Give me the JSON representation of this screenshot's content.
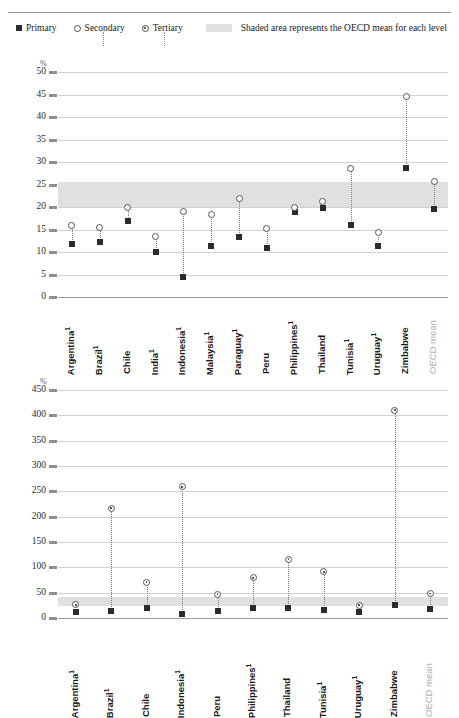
{
  "header": {
    "clipped_title": "",
    "legend": [
      {
        "label": "Primary",
        "marker": "filled-square-icon"
      },
      {
        "label": "Secondary",
        "marker": "open-circle-icon"
      },
      {
        "label": "Tertiary",
        "marker": "dotted-circle-icon"
      }
    ],
    "shaded_note": "Shaded area represents the OECD mean for each level",
    "shaded_swatch_color": "#e2e2e2"
  },
  "chart_data": [
    {
      "type": "scatter",
      "id": "chart-upper",
      "title": "",
      "xlabel": "",
      "ylabel": "%",
      "ylim": [
        0,
        50
      ],
      "yticks": [
        0,
        5,
        10,
        15,
        20,
        25,
        30,
        35,
        40,
        45,
        50
      ],
      "grid": true,
      "legend_position": "top",
      "band": {
        "label": "OECD mean",
        "from": 20.0,
        "to": 25.5,
        "color": "#e0e0e0"
      },
      "categories": [
        "Argentina¹",
        "Brazil¹",
        "Chile",
        "India¹",
        "Indonesia¹",
        "Malaysia¹",
        "Paraguay¹",
        "Peru",
        "Philippines¹",
        "Thailand",
        "Tunisia¹",
        "Uruguay¹",
        "Zimbabwe",
        "OECD mean"
      ],
      "series": [
        {
          "name": "Primary",
          "marker": "square",
          "values": [
            11.8,
            12.3,
            17.0,
            10.0,
            4.5,
            11.3,
            13.3,
            10.8,
            19.0,
            19.8,
            16.0,
            11.3,
            28.7,
            19.6
          ]
        },
        {
          "name": "Secondary",
          "marker": "circle",
          "values": [
            15.8,
            15.5,
            19.8,
            13.5,
            19.0,
            18.3,
            21.8,
            15.3,
            19.8,
            21.3,
            28.5,
            14.3,
            44.5,
            25.6
          ]
        }
      ]
    },
    {
      "type": "scatter",
      "id": "chart-lower",
      "title": "",
      "xlabel": "",
      "ylabel": "%",
      "ylim": [
        0,
        450
      ],
      "yticks": [
        0,
        50,
        100,
        150,
        200,
        250,
        300,
        350,
        400,
        450
      ],
      "grid": true,
      "legend_position": "top",
      "band": {
        "label": "OECD mean",
        "from": 23,
        "to": 42,
        "color": "#e0e0e0"
      },
      "categories": [
        "Argentina¹",
        "Brazil¹",
        "Chile",
        "Indonesia¹",
        "Peru",
        "Philippines¹",
        "Thailand",
        "Tunisia¹",
        "Uruguay¹",
        "Zimbabwe",
        "OECD mean"
      ],
      "series": [
        {
          "name": "Primary",
          "marker": "square",
          "values": [
            11.5,
            13.0,
            20.5,
            7.5,
            14.0,
            20.5,
            19.0,
            16.0,
            12.0,
            26.5,
            17.5
          ]
        },
        {
          "name": "Tertiary",
          "marker": "dotted-circle",
          "values": [
            26.0,
            217.0,
            71.0,
            259.0,
            47.0,
            79.0,
            116.0,
            91.0,
            25.0,
            410.0,
            48.0
          ]
        }
      ]
    }
  ]
}
